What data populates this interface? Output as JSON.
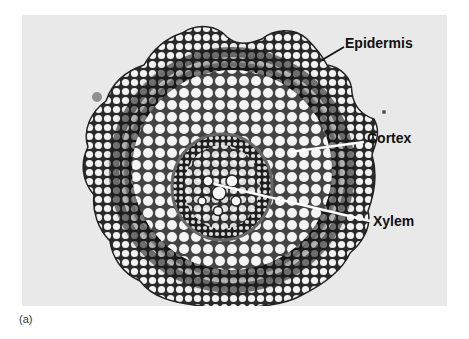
{
  "figure": {
    "caption": "(a)",
    "labels": [
      {
        "text": "Epidermis"
      },
      {
        "text": "Cortex"
      },
      {
        "text": "Xylem"
      }
    ]
  }
}
